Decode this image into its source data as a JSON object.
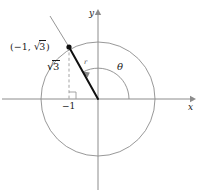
{
  "figure": {
    "kind": "unit-circle-trig-diagram",
    "axes": {
      "x_label": "x",
      "y_label": "y",
      "origin_px": [
        98,
        99
      ],
      "x_axis_from_px": [
        2,
        99
      ],
      "x_axis_to_px": [
        194,
        99
      ],
      "y_axis_from_px": [
        98,
        190
      ],
      "y_axis_to_px": [
        98,
        10
      ]
    },
    "circle": {
      "center_px": [
        98,
        99
      ],
      "radius_px": 57,
      "color": "#8c8c8c"
    },
    "point": {
      "label_text": "(−1, √3)",
      "label_open_paren": "(",
      "label_x_value": "−1",
      "label_comma": ", ",
      "label_radical_sign": "√",
      "label_radical_arg": "3",
      "label_close_paren": ")",
      "position_px": [
        69,
        47
      ],
      "marker_color": "#101010"
    },
    "radius_segment": {
      "label": "r",
      "color": "#101010",
      "from_px": [
        98,
        99
      ],
      "to_px": [
        69,
        47
      ]
    },
    "extension_line": {
      "label": "terminal-ray-extension",
      "color": "#8a8a8a",
      "from_px": [
        69,
        47
      ],
      "to_px": [
        50,
        16
      ]
    },
    "drop_line": {
      "label": "dashed-vertical-drop",
      "color": "#9a9a9a",
      "from_px": [
        69,
        47
      ],
      "to_px": [
        69,
        99
      ],
      "style": "dashed"
    },
    "right_angle_marker": {
      "label": "right-angle",
      "size_px": 7,
      "color": "#9a9a9a"
    },
    "angle_arc": {
      "label": "θ",
      "color": "#8a8a8a",
      "radius_px": 31,
      "start_deg": 0,
      "end_deg": 119,
      "direction": "counterclockwise",
      "arrowhead": true
    },
    "leg_labels": {
      "vertical_leg": {
        "radical_sign": "√",
        "radical_arg": "3",
        "text": "√3"
      },
      "horizontal_tick": {
        "text": "−1"
      }
    },
    "colors": {
      "axis": "#8c8c8c",
      "circle": "#8c8c8c",
      "radius": "#101010",
      "guide": "#9a9a9a",
      "text": "#1a1a1a",
      "background": "#ffffff"
    }
  }
}
